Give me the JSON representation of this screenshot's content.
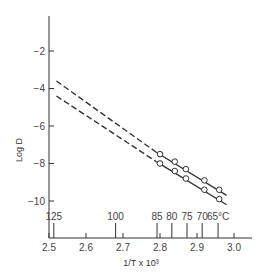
{
  "chart_data": {
    "type": "line",
    "title": "",
    "xlabel": "1/T x 10^3",
    "ylabel": "Log D",
    "xlim": [
      2.5,
      3.05
    ],
    "ylim": [
      -11.5,
      0
    ],
    "grid": false,
    "x_ticks": [
      "2.5",
      "2.6",
      "2.7",
      "2.8",
      "2.9",
      "3.0"
    ],
    "y_ticks": [
      "-2",
      "-4",
      "-6",
      "-8",
      "-10"
    ],
    "temperature_ticks": [
      {
        "label": "125",
        "x": 2.513
      },
      {
        "label": "100",
        "x": 2.68
      },
      {
        "label": "85",
        "x": 2.792
      },
      {
        "label": "80",
        "x": 2.832
      },
      {
        "label": "75",
        "x": 2.873
      },
      {
        "label": "70",
        "x": 2.914
      },
      {
        "label": "65°C",
        "x": 2.957
      }
    ],
    "series": [
      {
        "name": "upper",
        "points": [
          {
            "x": 2.8,
            "y": -7.5
          },
          {
            "x": 2.84,
            "y": -7.9
          },
          {
            "x": 2.87,
            "y": -8.3
          },
          {
            "x": 2.92,
            "y": -8.9
          },
          {
            "x": 2.96,
            "y": -9.4
          }
        ],
        "fit_solid": [
          {
            "x": 2.79,
            "y": -7.4
          },
          {
            "x": 2.98,
            "y": -9.7
          }
        ],
        "extrapolated_dashed": [
          {
            "x": 2.52,
            "y": -3.6
          },
          {
            "x": 2.79,
            "y": -7.4
          }
        ]
      },
      {
        "name": "lower",
        "points": [
          {
            "x": 2.8,
            "y": -8.0
          },
          {
            "x": 2.84,
            "y": -8.4
          },
          {
            "x": 2.87,
            "y": -8.8
          },
          {
            "x": 2.92,
            "y": -9.4
          },
          {
            "x": 2.96,
            "y": -9.9
          }
        ],
        "fit_solid": [
          {
            "x": 2.79,
            "y": -7.9
          },
          {
            "x": 2.98,
            "y": -10.2
          }
        ],
        "extrapolated_dashed": [
          {
            "x": 2.52,
            "y": -4.4
          },
          {
            "x": 2.79,
            "y": -7.9
          }
        ]
      }
    ]
  }
}
